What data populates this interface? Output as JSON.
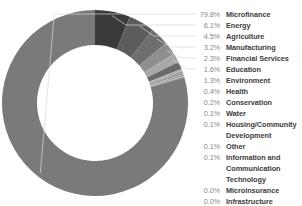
{
  "chart_data": {
    "type": "pie",
    "variant": "donut",
    "title": "",
    "subtitle": "",
    "xlabel": "",
    "ylabel": "",
    "legend_position": "right",
    "grid": false,
    "value_unit": "percent",
    "categories": [
      "Microfinance",
      "Energy",
      "Agriculture",
      "Manufacturing",
      "Financial Services",
      "Education",
      "Environment",
      "Health",
      "Conservation",
      "Water",
      "Housing/Community Development",
      "Other",
      "Information and Communication Technology",
      "Microinsurance",
      "Infrastructure"
    ],
    "values": [
      79.8,
      6.1,
      4.5,
      3.2,
      2.3,
      1.6,
      1.3,
      0.4,
      0.2,
      0.1,
      0.1,
      0.1,
      0.1,
      0.0,
      0.0
    ],
    "value_labels": [
      "79.8%",
      "6.1%",
      "4.5%",
      "3.2%",
      "2.3%",
      "1.6%",
      "1.3%",
      "0.4%",
      "0.2%",
      "0.1%",
      "0.1%",
      "0.1%",
      "0.1%",
      "0.0%",
      "0.0%"
    ],
    "colors": [
      "#7a7a7a",
      "#3a3a3a",
      "#5c5c5c",
      "#6e6e6e",
      "#8e8e8e",
      "#a8a8a8",
      "#6a6a6a",
      "#b4b4b4",
      "#8a8a8a",
      "#9e9e9e",
      "#717171",
      "#c4c4c4",
      "#888888",
      "#9a9a9a",
      "#adadad"
    ]
  },
  "legend": {
    "rows": [
      {
        "pct": "79.8%",
        "label": "Microfinance",
        "continuation": false
      },
      {
        "pct": "6.1%",
        "label": "Energy",
        "continuation": false
      },
      {
        "pct": "4.5%",
        "label": "Agriculture",
        "continuation": false
      },
      {
        "pct": "3.2%",
        "label": "Manufacturing",
        "continuation": false
      },
      {
        "pct": "2.3%",
        "label": "Financial Services",
        "continuation": false
      },
      {
        "pct": "1.6%",
        "label": "Education",
        "continuation": false
      },
      {
        "pct": "1.3%",
        "label": "Environment",
        "continuation": false
      },
      {
        "pct": "0.4%",
        "label": "Health",
        "continuation": false
      },
      {
        "pct": "0.2%",
        "label": "Conservation",
        "continuation": false
      },
      {
        "pct": "0.1%",
        "label": "Water",
        "continuation": false
      },
      {
        "pct": "0.1%",
        "label": "Housing/Community",
        "continuation": false
      },
      {
        "pct": "",
        "label": "Development",
        "continuation": true
      },
      {
        "pct": "0.1%",
        "label": "Other",
        "continuation": false
      },
      {
        "pct": "0.1%",
        "label": "Information and",
        "continuation": false
      },
      {
        "pct": "",
        "label": "Communication",
        "continuation": true
      },
      {
        "pct": "",
        "label": "Technology",
        "continuation": true
      },
      {
        "pct": "0.0%",
        "label": "Microinsurance",
        "continuation": false
      },
      {
        "pct": "0.0%",
        "label": "Infrastructure",
        "continuation": false
      }
    ]
  },
  "geometry": {
    "cx": 95,
    "cy": 103,
    "outer_radius": 93,
    "inner_radius": 58,
    "start_angle_deg": -90
  },
  "style": {
    "background": "#ffffff",
    "leader_line_color": "#d8d8d8",
    "pct_color": "#8a8a8a",
    "label_color": "#3d3d3d"
  },
  "leader_lines": [
    {
      "from_index": 0,
      "y": 14
    },
    {
      "from_index": 1,
      "y": 25
    },
    {
      "from_index": 2,
      "y": 36
    },
    {
      "from_index": 3,
      "y": 47
    },
    {
      "from_index": 4,
      "y": 58
    },
    {
      "from_index": 5,
      "y": 69
    }
  ]
}
